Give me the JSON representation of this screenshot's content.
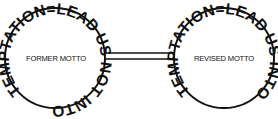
{
  "diagram": {
    "left_seal": {
      "ring_text": "TEMPTATION=LEAD US NOT INTO",
      "center_label": "FORMER MOTTO"
    },
    "right_seal": {
      "ring_text": "TEMPTATION=LEAD US INTO",
      "center_label": "REVISED MOTTO"
    },
    "colors": {
      "ink": "#111111",
      "background": "#ffffff"
    }
  }
}
